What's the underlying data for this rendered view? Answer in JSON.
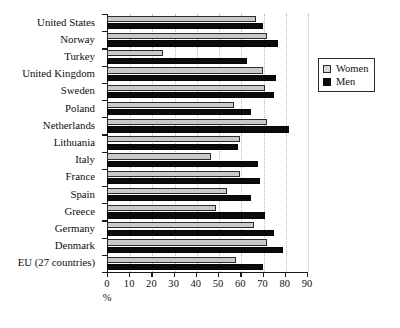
{
  "chart_data": {
    "type": "bar",
    "orientation": "horizontal",
    "title": "",
    "xlabel": "%",
    "ylabel": "",
    "xlim": [
      0,
      90
    ],
    "xticks": [
      0,
      10,
      20,
      30,
      40,
      50,
      60,
      70,
      80,
      90
    ],
    "grid": true,
    "grid_axis": "x",
    "legend_position": "upper right",
    "categories": [
      "United States",
      "Norway",
      "Turkey",
      "United Kingdom",
      "Sweden",
      "Poland",
      "Netherlands",
      "Lithuania",
      "Italy",
      "France",
      "Spain",
      "Greece",
      "Germany",
      "Denmark",
      "EU (27 countries)"
    ],
    "series": [
      {
        "name": "Women",
        "color": "#c9c9c9",
        "values": [
          67,
          72,
          25,
          70,
          71,
          57,
          72,
          60,
          47,
          60,
          54,
          49,
          66,
          72,
          58
        ]
      },
      {
        "name": "Men",
        "color": "#0b0b0b",
        "values": [
          70,
          77,
          63,
          76,
          75,
          65,
          82,
          59,
          68,
          69,
          65,
          71,
          75,
          79,
          70
        ]
      }
    ]
  },
  "legend": {
    "items": [
      {
        "label": "Women",
        "swatch": "women"
      },
      {
        "label": "Men",
        "swatch": "men"
      }
    ]
  },
  "axis": {
    "x_title": "%",
    "tick_labels": [
      "0",
      "10",
      "20",
      "30",
      "40",
      "50",
      "60",
      "70",
      "80",
      "90"
    ]
  },
  "caption": {
    "text": ""
  }
}
